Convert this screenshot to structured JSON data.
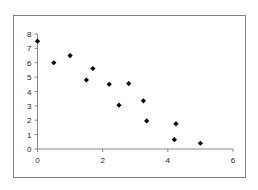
{
  "chart_data": {
    "type": "scatter",
    "title": "",
    "xlabel": "",
    "ylabel": "",
    "xlim": [
      0,
      6
    ],
    "ylim": [
      0,
      8
    ],
    "x_ticks": [
      0,
      2,
      4,
      6
    ],
    "y_ticks": [
      0,
      1,
      2,
      3,
      4,
      5,
      6,
      7,
      8
    ],
    "grid": false,
    "legend": null,
    "marker": "diamond",
    "marker_color": "#000000",
    "series": [
      {
        "name": "series1",
        "points": [
          {
            "x": 0.0,
            "y": 7.5
          },
          {
            "x": 0.5,
            "y": 6.0
          },
          {
            "x": 1.0,
            "y": 6.5
          },
          {
            "x": 1.5,
            "y": 4.8
          },
          {
            "x": 1.7,
            "y": 5.6
          },
          {
            "x": 2.2,
            "y": 4.5
          },
          {
            "x": 2.5,
            "y": 3.05
          },
          {
            "x": 2.8,
            "y": 4.55
          },
          {
            "x": 3.25,
            "y": 3.35
          },
          {
            "x": 3.35,
            "y": 1.95
          },
          {
            "x": 4.2,
            "y": 0.65
          },
          {
            "x": 4.25,
            "y": 1.75
          },
          {
            "x": 5.0,
            "y": 0.4
          }
        ]
      }
    ]
  },
  "axes": {
    "x_tick_labels": [
      "0",
      "2",
      "4",
      "6"
    ],
    "y_tick_labels": [
      "0",
      "1",
      "2",
      "3",
      "4",
      "5",
      "6",
      "7",
      "8"
    ],
    "axis_color": "#888888"
  }
}
